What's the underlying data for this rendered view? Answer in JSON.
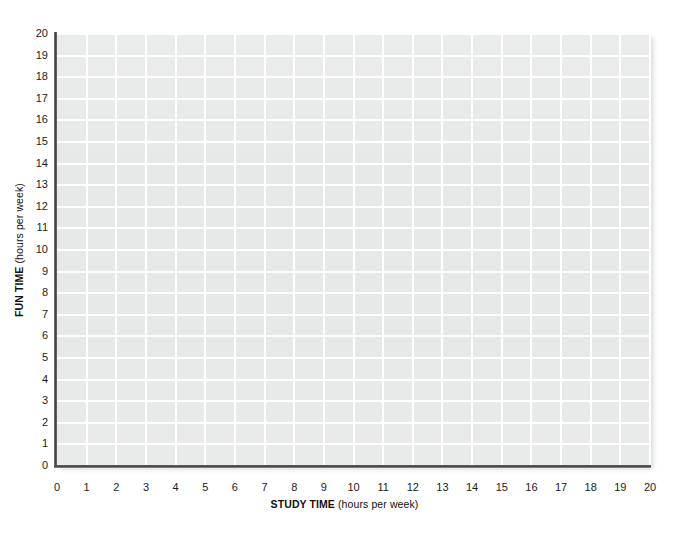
{
  "chart_data": {
    "type": "scatter",
    "title": "",
    "subtitle": "",
    "xlabel_bold": "STUDY TIME",
    "xlabel_unit": "(hours per week)",
    "ylabel_bold": "FUN TIME",
    "ylabel_unit": "(hours per week)",
    "xlabel": "STUDY TIME (hours per week)",
    "ylabel": "FUN TIME (hours per week)",
    "xlim": [
      0,
      20
    ],
    "ylim": [
      0,
      20
    ],
    "xticks": [
      0,
      1,
      2,
      3,
      4,
      5,
      6,
      7,
      8,
      9,
      10,
      11,
      12,
      13,
      14,
      15,
      16,
      17,
      18,
      19,
      20
    ],
    "yticks": [
      0,
      1,
      2,
      3,
      4,
      5,
      6,
      7,
      8,
      9,
      10,
      11,
      12,
      13,
      14,
      15,
      16,
      17,
      18,
      19,
      20
    ],
    "xtick_labels": [
      "0",
      "1",
      "2",
      "3",
      "4",
      "5",
      "6",
      "7",
      "8",
      "9",
      "10",
      "11",
      "12",
      "13",
      "14",
      "15",
      "16",
      "17",
      "18",
      "19",
      "20"
    ],
    "ytick_labels": [
      "0",
      "1",
      "2",
      "3",
      "4",
      "5",
      "6",
      "7",
      "8",
      "9",
      "10",
      "11",
      "12",
      "13",
      "14",
      "15",
      "16",
      "17",
      "18",
      "19",
      "20"
    ],
    "grid": true,
    "grid_color": "#ffffff",
    "plot_background": "#e7e8e8",
    "axis_color": "#3a3a3a",
    "legend": [],
    "legend_position": "none",
    "annotations": [],
    "series": [
      {
        "name": "",
        "x": [],
        "y": [],
        "values": []
      }
    ],
    "note": "Blank plotting grid — no data points are plotted"
  },
  "figure": {
    "background": "#ffffff",
    "width": 689,
    "height": 535
  }
}
